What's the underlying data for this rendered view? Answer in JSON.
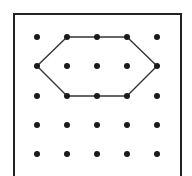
{
  "diagram": {
    "type": "geoboard",
    "grid": {
      "rows": 5,
      "cols": 5,
      "x_positions": [
        37,
        67,
        97,
        127,
        157
      ],
      "y_positions": [
        37,
        66,
        96,
        125,
        154
      ],
      "dot_radius": 3,
      "dot_color": "#1a1a1a"
    },
    "frame": {
      "x": 14,
      "y": 14,
      "width": 167,
      "height": 163,
      "stroke": "#222222",
      "stroke_width": 2
    },
    "polygon": {
      "shape": "hexagon",
      "vertices_grid": [
        [
          1,
          0
        ],
        [
          2,
          0
        ],
        [
          3,
          0
        ],
        [
          4,
          1
        ],
        [
          3,
          2
        ],
        [
          2,
          2
        ],
        [
          1,
          2
        ],
        [
          0,
          1
        ]
      ],
      "stroke": "#333333",
      "stroke_width": 1.4
    }
  }
}
